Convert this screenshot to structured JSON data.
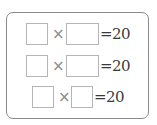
{
  "problem": {
    "operator": "×",
    "equals": "=",
    "rows": [
      {
        "left": "",
        "right": "",
        "result": "20"
      },
      {
        "left": "",
        "right": "",
        "result": "20"
      },
      {
        "left": "",
        "right": "",
        "result": "20"
      }
    ]
  }
}
